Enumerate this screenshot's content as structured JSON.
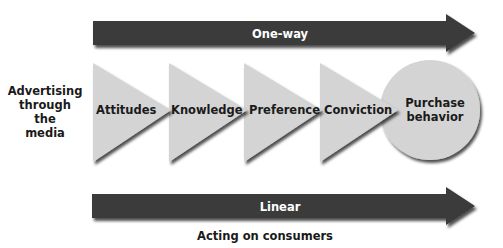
{
  "diagram": {
    "title": "",
    "source_label": {
      "lines": [
        "Advertising",
        "through",
        "the",
        "media"
      ]
    },
    "top_arrow": {
      "label": "One-way",
      "color": "#3a3a3a"
    },
    "stages": [
      {
        "label": "Attitudes",
        "shape": "triangle"
      },
      {
        "label": "Knowledge",
        "shape": "triangle"
      },
      {
        "label": "Preference",
        "shape": "triangle"
      },
      {
        "label": "Conviction",
        "shape": "triangle"
      }
    ],
    "outcome": {
      "lines": [
        "Purchase",
        "behavior"
      ],
      "shape": "circle"
    },
    "bottom_arrow": {
      "label": "Linear",
      "color": "#3a3a3a"
    },
    "caption": "Acting on consumers",
    "colors": {
      "shape_fill": "#d4d4d4",
      "arrow_fill": "#3a3a3a",
      "text": "#1a1a1a"
    }
  }
}
